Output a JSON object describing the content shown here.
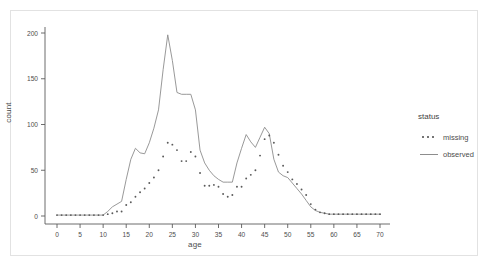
{
  "figure": {
    "panel_border_color": "#e2e2e2",
    "background": "#ffffff"
  },
  "legend": {
    "title": "status",
    "items": [
      {
        "label": "missing",
        "style": "dotted",
        "color": "#5a5a5a"
      },
      {
        "label": "observed",
        "style": "solid",
        "color": "#8d8d8d"
      }
    ]
  },
  "chart_data": {
    "type": "line",
    "title": "",
    "xlabel": "age",
    "ylabel": "count",
    "xlim": [
      -2,
      73
    ],
    "ylim": [
      0,
      210
    ],
    "xticks": [
      0,
      5,
      10,
      15,
      20,
      25,
      30,
      35,
      40,
      45,
      50,
      55,
      60,
      65,
      70
    ],
    "yticks": [
      0,
      50,
      100,
      150,
      200
    ],
    "grid": false,
    "legend_position": "right",
    "legend_title": "status",
    "x": [
      0,
      1,
      2,
      3,
      4,
      5,
      6,
      7,
      8,
      9,
      10,
      11,
      12,
      13,
      14,
      15,
      16,
      17,
      18,
      19,
      20,
      21,
      22,
      23,
      24,
      25,
      26,
      27,
      28,
      29,
      30,
      31,
      32,
      33,
      34,
      35,
      36,
      37,
      38,
      39,
      40,
      41,
      42,
      43,
      44,
      45,
      46,
      47,
      48,
      49,
      50,
      51,
      52,
      53,
      54,
      55,
      56,
      57,
      58,
      59,
      60,
      61,
      62,
      63,
      64,
      65,
      66,
      67,
      68,
      69,
      70
    ],
    "series": [
      {
        "name": "observed",
        "style": "solid",
        "color": "#8d8d8d",
        "values": [
          1,
          1,
          1,
          1,
          1,
          1,
          1,
          1,
          1,
          1,
          1,
          5,
          10,
          13,
          16,
          40,
          62,
          74,
          69,
          68,
          80,
          96,
          116,
          160,
          198,
          170,
          135,
          133,
          133,
          133,
          116,
          72,
          58,
          50,
          44,
          40,
          37,
          37,
          37,
          58,
          74,
          89,
          81,
          75,
          86,
          97,
          90,
          62,
          48,
          44,
          42,
          36,
          30,
          24,
          17,
          10,
          6,
          4,
          3,
          2,
          2,
          2,
          2,
          2,
          2,
          2,
          2,
          2,
          2,
          2,
          2
        ]
      },
      {
        "name": "missing",
        "style": "dotted",
        "color": "#5a5a5a",
        "values": [
          1,
          1,
          1,
          1,
          1,
          1,
          1,
          1,
          1,
          1,
          1,
          2,
          3,
          5,
          5,
          12,
          15,
          21,
          26,
          30,
          36,
          42,
          50,
          65,
          80,
          78,
          72,
          60,
          60,
          70,
          65,
          47,
          33,
          33,
          34,
          32,
          24,
          21,
          23,
          32,
          32,
          41,
          45,
          50,
          66,
          84,
          88,
          80,
          67,
          55,
          48,
          40,
          35,
          29,
          23,
          13,
          7,
          4,
          3,
          2,
          2,
          2,
          2,
          2,
          2,
          2,
          2,
          2,
          2,
          2,
          2
        ]
      }
    ]
  }
}
